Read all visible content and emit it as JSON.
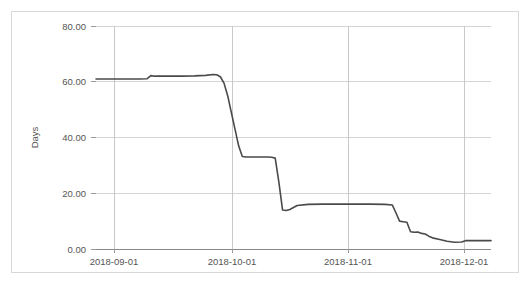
{
  "chart_data": {
    "type": "line",
    "title": "",
    "subtitle": "",
    "xlabel": "",
    "ylabel": "Days",
    "legend": [],
    "legend_position": "none",
    "grid": true,
    "xlim": [
      "2018-08-22",
      "2018-12-08"
    ],
    "ylim": [
      0,
      80
    ],
    "y_ticks": [
      0,
      20,
      40,
      60,
      80
    ],
    "y_tick_labels": [
      "0.00",
      "20.00",
      "40.00",
      "60.00",
      "80.00"
    ],
    "x_ticks": [
      "2018-09-01",
      "2018-10-01",
      "2018-11-01",
      "2018-12-01"
    ],
    "x_tick_labels": [
      "2018-09-01",
      "2018-10-01",
      "2018-11-01",
      "2018-12-01"
    ],
    "series": [
      {
        "name": "Days",
        "color": "#4a4a4a",
        "x": [
          "2018-08-22",
          "2018-08-26",
          "2018-08-30",
          "2018-09-01",
          "2018-09-03",
          "2018-09-05",
          "2018-09-06",
          "2018-09-07",
          "2018-09-10",
          "2018-09-14",
          "2018-09-18",
          "2018-09-21",
          "2018-09-23",
          "2018-09-24",
          "2018-09-25",
          "2018-09-26",
          "2018-09-27",
          "2018-09-28",
          "2018-09-29",
          "2018-09-30",
          "2018-10-01",
          "2018-10-02",
          "2018-10-04",
          "2018-10-07",
          "2018-10-08",
          "2018-10-09",
          "2018-10-10",
          "2018-10-11",
          "2018-10-12",
          "2018-10-13",
          "2018-10-14",
          "2018-10-16",
          "2018-10-19",
          "2018-10-23",
          "2018-10-28",
          "2018-11-01",
          "2018-11-05",
          "2018-11-09",
          "2018-11-11",
          "2018-11-12",
          "2018-11-13",
          "2018-11-14",
          "2018-11-15",
          "2018-11-16",
          "2018-11-17",
          "2018-11-18",
          "2018-11-19",
          "2018-11-20",
          "2018-11-21",
          "2018-11-22",
          "2018-11-24",
          "2018-11-26",
          "2018-11-28",
          "2018-11-30",
          "2018-12-01",
          "2018-12-04",
          "2018-12-08"
        ],
        "values": [
          61.0,
          61.0,
          61.0,
          61.0,
          61.0,
          61.1,
          62.2,
          62.0,
          62.0,
          62.0,
          62.1,
          62.3,
          62.6,
          62.5,
          61.8,
          59.5,
          55.0,
          49.0,
          43.0,
          37.0,
          33.2,
          33.0,
          33.0,
          33.0,
          33.0,
          32.9,
          32.6,
          24.0,
          14.0,
          13.8,
          14.2,
          15.6,
          16.0,
          16.1,
          16.1,
          16.1,
          16.1,
          16.0,
          15.8,
          13.0,
          10.0,
          9.8,
          9.6,
          6.2,
          6.0,
          6.1,
          5.6,
          5.4,
          4.6,
          4.0,
          3.4,
          2.8,
          2.4,
          2.5,
          3.0,
          3.0,
          3.0
        ]
      }
    ]
  }
}
